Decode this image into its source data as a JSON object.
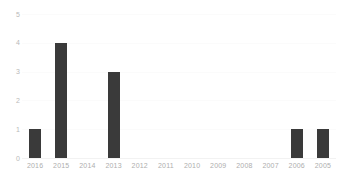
{
  "chart_data": {
    "type": "bar",
    "title": "",
    "subtitle": "",
    "xlabel": "",
    "ylabel": "",
    "categories": [
      "2016",
      "2015",
      "2014",
      "2013",
      "2012",
      "2011",
      "2010",
      "2009",
      "2008",
      "2007",
      "2006",
      "2005"
    ],
    "values": [
      1,
      4,
      0,
      3,
      0,
      0,
      0,
      0,
      0,
      0,
      1,
      1
    ],
    "ylim": [
      0,
      5
    ],
    "yticks": [
      "0",
      "1",
      "2",
      "3",
      "4",
      "5"
    ],
    "ytick_values": [
      0,
      1,
      2,
      3,
      4,
      5
    ],
    "grid": true,
    "grid_axis": "y",
    "legend": false,
    "legend_position": "none",
    "bar_color": "#3a3a3a",
    "gridline_color": "#fbfbfb",
    "baseline_color": "#f2f2f2",
    "tick_label_color": "#b0b0b0",
    "background_color": "#ffffff"
  }
}
